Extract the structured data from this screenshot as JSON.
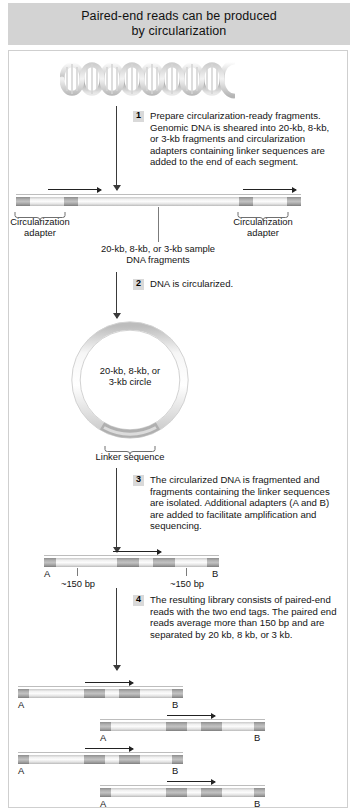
{
  "header": {
    "title_line1": "Paired-end reads can be produced",
    "title_line2": "by circularization"
  },
  "steps": [
    {
      "number": "1",
      "text": "Prepare circularization-ready fragments. Genomic DNA is sheared into 20-kb, 8-kb, or 3-kb fragments and circularization adapters containing linker sequences are added to the end of each segment."
    },
    {
      "number": "2",
      "text": "DNA is circularized."
    },
    {
      "number": "3",
      "text": "The circularized DNA is fragmented and fragments containing the linker sequences are isolated. Additional adapters (A and B) are added to facilitate amplification and sequencing."
    },
    {
      "number": "4",
      "text": "The resulting library consists of paired-end reads with the two end tags. The paired end reads average more than 150 bp and are separated by 20 kb, 8 kb, or 3 kb."
    }
  ],
  "labels": {
    "adapter_left_line1": "Circularization",
    "adapter_left_line2": "adapter",
    "adapter_right_line1": "Circularization",
    "adapter_right_line2": "adapter",
    "fragment_line1": "20-kb, 8-kb, or 3-kb sample",
    "fragment_line2": "DNA fragments",
    "circle_line1": "20-kb, 8-kb, or",
    "circle_line2": "3-kb circle",
    "linker_sequence": "Linker sequence",
    "bp_left": "~150 bp",
    "bp_right": "~150 bp",
    "adapter_a": "A",
    "adapter_b": "B"
  },
  "library_reads": [
    {
      "adapter_a": "A",
      "adapter_b": "B"
    },
    {
      "adapter_a": "A",
      "adapter_b": "B"
    },
    {
      "adapter_a": "A",
      "adapter_b": "B"
    },
    {
      "adapter_a": "A",
      "adapter_b": "B"
    }
  ],
  "colors": {
    "header_bg": "#d3d3d3",
    "panel_border": "#cfcfcf",
    "text": "#141414",
    "arrow": "#3a3a3a",
    "adapter_block": "#9a9a9a",
    "bar_body": "#ededed"
  }
}
